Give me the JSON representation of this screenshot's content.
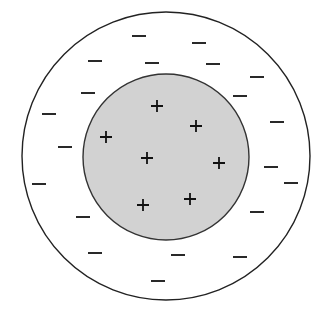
{
  "diagram": {
    "outer_circle": {
      "cx": 166,
      "cy": 156,
      "r": 144,
      "fill": "#ffffff",
      "stroke": "#222222"
    },
    "inner_circle": {
      "cx": 166,
      "cy": 157,
      "r": 83,
      "fill": "#d2d2d2",
      "stroke": "#333333"
    },
    "plus_charges": [
      [
        157,
        106
      ],
      [
        196,
        126
      ],
      [
        106,
        137
      ],
      [
        147,
        158
      ],
      [
        219,
        163
      ],
      [
        143,
        205
      ],
      [
        190,
        199
      ]
    ],
    "minus_charges": [
      [
        139,
        36
      ],
      [
        199,
        43
      ],
      [
        95,
        61
      ],
      [
        152,
        63
      ],
      [
        213,
        64
      ],
      [
        257,
        77
      ],
      [
        88,
        93
      ],
      [
        240,
        96
      ],
      [
        49,
        114
      ],
      [
        277,
        122
      ],
      [
        65,
        147
      ],
      [
        39,
        184
      ],
      [
        271,
        167
      ],
      [
        291,
        183
      ],
      [
        83,
        217
      ],
      [
        257,
        212
      ],
      [
        95,
        253
      ],
      [
        178,
        255
      ],
      [
        240,
        257
      ],
      [
        158,
        281
      ]
    ]
  }
}
